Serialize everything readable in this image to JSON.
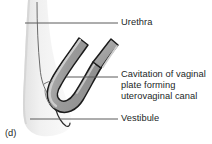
{
  "figure": {
    "panel_letter": "(d)",
    "background_color": "#ffffff",
    "text_color": "#221f1f",
    "leader_line_color": "#5b5b5b",
    "outline_color": "#1a1a1a",
    "tissue_fill_color": "#ececec",
    "plate_fill_color": "#9d9d9d",
    "plate_highlight_color": "#c9c9c9"
  },
  "labels": {
    "urethra": "Urethra",
    "cavitation_line1": "Cavitation of vaginal",
    "cavitation_line2": "plate forming",
    "cavitation_line3": "uterovaginal canal",
    "vestibule": "Vestibule"
  },
  "leaders": [
    {
      "name": "urethra-leader",
      "x1": 25,
      "y1": 23,
      "x2": 118,
      "y2": 23
    },
    {
      "name": "cavitation-leader",
      "x1": 66,
      "y1": 77,
      "x2": 118,
      "y2": 77
    },
    {
      "name": "vestibule-leader",
      "x1": 30,
      "y1": 119,
      "x2": 118,
      "y2": 119
    }
  ]
}
